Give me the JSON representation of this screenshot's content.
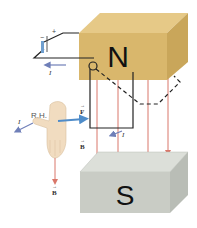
{
  "figure": {
    "north_pole_label": "N",
    "south_pole_label": "S",
    "battery": {
      "plus": "+",
      "minus": "−"
    },
    "current_label": "I",
    "hand_label": "R.H.",
    "force_label": "F",
    "field_label": "B",
    "vector_arrow": "→"
  },
  "colors": {
    "north_magnet": "#d9b76c",
    "north_magnet_top": "#e6c987",
    "north_magnet_side": "#c9a65a",
    "south_magnet": "#c9ccc5",
    "south_magnet_top": "#dcdfd9",
    "south_magnet_side": "#b9bdb6",
    "field_lines": "#d9776a",
    "current_arrow": "#6f7fb8",
    "force_arrow": "#4f8cc9",
    "wire": "#222222",
    "hand": "#f1dcc0"
  }
}
